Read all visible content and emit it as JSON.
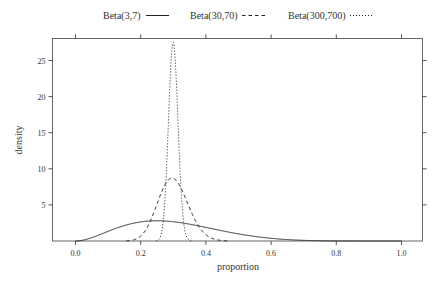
{
  "chart_data": {
    "type": "line",
    "title": "",
    "xlabel": "proportion",
    "ylabel": "density",
    "xlim": [
      -0.07,
      1.07
    ],
    "ylim": [
      0,
      28
    ],
    "x_ticks": [
      0.0,
      0.2,
      0.4,
      0.6,
      0.8,
      1.0
    ],
    "x_tick_labels": [
      "0.0",
      "0.2",
      "0.4",
      "0.6",
      "0.8",
      "1.0"
    ],
    "y_ticks": [
      5,
      10,
      15,
      20,
      25
    ],
    "y_tick_labels": [
      "5",
      "10",
      "15",
      "20",
      "25"
    ],
    "grid": false,
    "legend_position": "top",
    "series": [
      {
        "name": "Beta(3,7)",
        "alpha": 3,
        "beta": 7,
        "line_style": "solid",
        "peak_x": 0.25,
        "peak_y": 2.9
      },
      {
        "name": "Beta(30,70)",
        "alpha": 30,
        "beta": 70,
        "line_style": "dashed",
        "peak_x": 0.29,
        "peak_y": 8.8
      },
      {
        "name": "Beta(300,700)",
        "alpha": 300,
        "beta": 700,
        "line_style": "dotted",
        "peak_x": 0.3,
        "peak_y": 27.5
      }
    ]
  },
  "legend": {
    "items": [
      {
        "label": "Beta(3,7)",
        "style": "solid"
      },
      {
        "label": "Beta(30,70)",
        "style": "dashed"
      },
      {
        "label": "Beta(300,700)",
        "style": "dotted"
      }
    ]
  },
  "axes": {
    "xlabel": "proportion",
    "ylabel": "density"
  },
  "colors": {
    "line": "#222222",
    "axis": "#555555",
    "text": "#333333",
    "background": "#ffffff"
  }
}
